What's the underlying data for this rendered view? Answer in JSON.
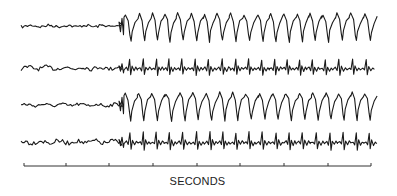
{
  "chart_data": {
    "type": "line",
    "title": "",
    "xlabel": "SECONDS",
    "ylabel": "",
    "x_axis": {
      "ticks_count": 9,
      "tick_interval_label": "1 s (unlabeled)",
      "tick_positions_px": [
        24,
        66,
        109,
        153,
        197,
        240,
        284,
        328,
        371
      ],
      "range_seconds": [
        0,
        8
      ]
    },
    "onset_seconds": 2.3,
    "discharge_rate_hz": 3.3,
    "series": [
      {
        "name": "channel-1",
        "baseline_y": 26,
        "pre_amp": 1.4,
        "post_amp": 16,
        "spike_dir": 1
      },
      {
        "name": "channel-2",
        "baseline_y": 68,
        "pre_amp": 2.0,
        "post_amp": 9,
        "spike_dir": -1
      },
      {
        "name": "channel-3",
        "baseline_y": 105,
        "pre_amp": 1.6,
        "post_amp": 16,
        "spike_dir": 1
      },
      {
        "name": "channel-4",
        "baseline_y": 142,
        "pre_amp": 2.2,
        "post_amp": 10,
        "spike_dir": -1
      }
    ],
    "grid": false,
    "legend": "none"
  },
  "colors": {
    "trace": "#1a1a1a",
    "axis": "#333333",
    "background": "#ffffff"
  },
  "layout": {
    "trace_x_start": 21,
    "trace_x_end": 376,
    "axis_y": 166,
    "onset_x": 122,
    "cycle_px": 13.3
  }
}
